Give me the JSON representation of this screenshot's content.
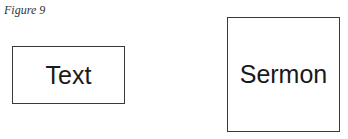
{
  "figure": {
    "caption": "Figure 9",
    "boxes": [
      {
        "label": "Text"
      },
      {
        "label": "Sermon"
      }
    ]
  }
}
